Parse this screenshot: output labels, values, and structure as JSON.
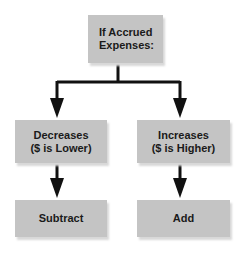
{
  "diagram": {
    "type": "flowchart",
    "colors": {
      "box_fill": "#c4c4c4",
      "arrow": "#111111",
      "text": "#1a1a1a"
    },
    "nodes": {
      "root": {
        "label": "If Accrued\nExpenses:"
      },
      "decreases": {
        "label": "Decreases\n($ is Lower)"
      },
      "increases": {
        "label": "Increases\n($ is Higher)"
      },
      "subtract": {
        "label": "Subtract"
      },
      "add": {
        "label": "Add"
      }
    },
    "edges": [
      {
        "from": "root",
        "to": "decreases"
      },
      {
        "from": "root",
        "to": "increases"
      },
      {
        "from": "decreases",
        "to": "subtract"
      },
      {
        "from": "increases",
        "to": "add"
      }
    ]
  }
}
